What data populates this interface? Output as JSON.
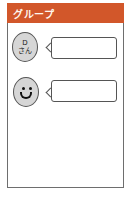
{
  "header": {
    "title": "グループ",
    "color": "#d2572a"
  },
  "messages": [
    {
      "avatar_type": "named",
      "avatar_line1": "D",
      "avatar_line2": "さん",
      "text": ""
    },
    {
      "avatar_type": "smiley-icon",
      "text": ""
    }
  ]
}
